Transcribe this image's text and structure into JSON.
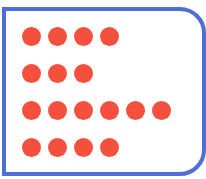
{
  "figure": {
    "border_color": "#4f6fd8",
    "dot_color": "#f4503d",
    "rows": [
      {
        "count": 4
      },
      {
        "count": 3
      },
      {
        "count": 6
      },
      {
        "count": 4
      }
    ]
  }
}
